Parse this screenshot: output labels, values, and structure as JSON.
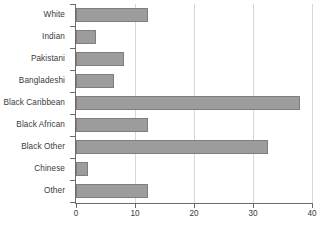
{
  "chart_data": {
    "type": "bar",
    "orientation": "horizontal",
    "title": "",
    "subtitle": "",
    "xlabel": "",
    "ylabel": "",
    "categories": [
      "White",
      "Indian",
      "Pakistani",
      "Bangladeshi",
      "Black Caribbean",
      "Black African",
      "Black Other",
      "Chinese",
      "Other"
    ],
    "values": [
      12.2,
      3.4,
      8.1,
      6.4,
      38.0,
      12.2,
      32.5,
      2.0,
      12.2
    ],
    "xlim": [
      0,
      40
    ],
    "xticks": [
      0,
      10,
      20,
      30,
      40
    ],
    "xtick_labels": [
      "0",
      "10",
      "20",
      "30",
      "40"
    ],
    "grid": true,
    "grid_axis": "x",
    "legend": false,
    "legend_position": "none",
    "colors": {
      "bar_fill": "#9c9c9c",
      "bar_edge": "#7e7e7e",
      "gridline": "#d7d7d7",
      "axis": "#6b6b6b",
      "text": "#3a3a3a",
      "background": "#ffffff"
    }
  }
}
